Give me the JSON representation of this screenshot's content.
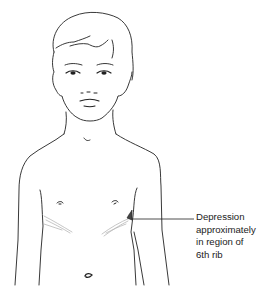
{
  "figure": {
    "annotation": {
      "lines": [
        "Depression",
        "approximately",
        "in region of",
        "6th rib"
      ]
    },
    "colors": {
      "line": "#222222",
      "shading": "#b8b8b8",
      "background": "#ffffff"
    }
  }
}
